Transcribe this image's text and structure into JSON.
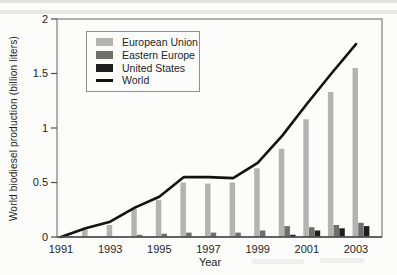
{
  "chart_data": {
    "type": "bar+line",
    "title": "",
    "xlabel": "Year",
    "ylabel": "World biodiesel production (billion liters)",
    "ylim": [
      0,
      2
    ],
    "grid": false,
    "legend_position": "upper-left",
    "x": [
      1991,
      1992,
      1993,
      1994,
      1995,
      1996,
      1997,
      1998,
      1999,
      2000,
      2001,
      2002,
      2003
    ],
    "x_tick_labels": [
      "1991",
      "1993",
      "1995",
      "1997",
      "1999",
      "2001",
      "2003"
    ],
    "y_ticks": [
      0,
      0.5,
      1,
      1.5,
      2
    ],
    "y_tick_labels": [
      "0",
      "0.5",
      "1",
      "1.5",
      "2"
    ],
    "series": [
      {
        "name": "European Union",
        "type": "bar",
        "color": "#b3b3b3",
        "values": [
          0.01,
          0.07,
          0.11,
          0.26,
          0.34,
          0.5,
          0.49,
          0.5,
          0.63,
          0.81,
          1.08,
          1.33,
          1.55
        ]
      },
      {
        "name": "Eastern Europe",
        "type": "bar",
        "color": "#6e6e6e",
        "values": [
          0,
          0,
          0,
          0.02,
          0.03,
          0.04,
          0.04,
          0.04,
          0.06,
          0.1,
          0.09,
          0.11,
          0.13
        ]
      },
      {
        "name": "United States",
        "type": "bar",
        "color": "#1e1e1e",
        "values": [
          0,
          0,
          0,
          0,
          0,
          0,
          0,
          0,
          0,
          0.02,
          0.06,
          0.08,
          0.1
        ]
      },
      {
        "name": "World",
        "type": "line",
        "color": "#121212",
        "values": [
          0.0,
          0.08,
          0.14,
          0.27,
          0.37,
          0.55,
          0.55,
          0.54,
          0.68,
          0.93,
          1.22,
          1.5,
          1.77
        ]
      }
    ],
    "style": {
      "frame_color": "#7e7e7e",
      "axis_color": "#4a4a4a",
      "text_color": "#242424"
    }
  }
}
